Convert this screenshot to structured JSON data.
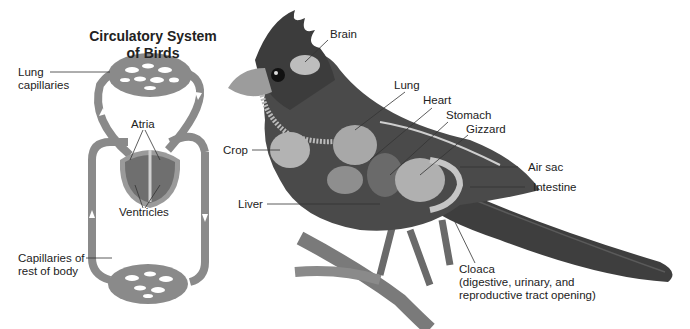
{
  "circulatory_diagram": {
    "title_line1": "Circulatory System",
    "title_line2": "of Birds",
    "labels": {
      "lung_capillaries_1": "Lung",
      "lung_capillaries_2": "capillaries",
      "atria": "Atria",
      "ventricles": "Ventricles",
      "body_capillaries_1": "Capillaries of",
      "body_capillaries_2": "rest of body"
    }
  },
  "bird_anatomy": {
    "labels": {
      "brain": "Brain",
      "lung": "Lung",
      "heart": "Heart",
      "stomach": "Stomach",
      "gizzard": "Gizzard",
      "crop": "Crop",
      "air_sac": "Air sac",
      "intestine": "Intestine",
      "liver": "Liver",
      "cloaca_1": "Cloaca",
      "cloaca_2": "(digestive, urinary, and",
      "cloaca_3": "reproductive tract opening)"
    }
  },
  "colors": {
    "vessel": "#8a8a8a",
    "heart": "#7a7a7a",
    "bird_dark": "#3a3a3a",
    "bird_mid": "#6e6e6e",
    "organ_light": "#b8b8b8",
    "leader_line": "#333333"
  }
}
